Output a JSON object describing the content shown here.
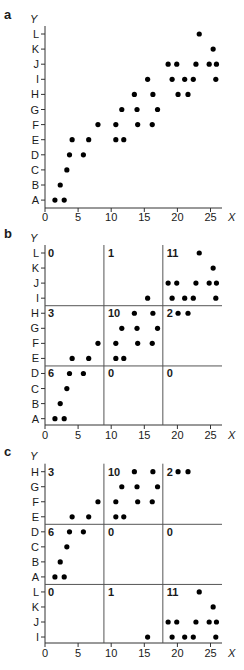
{
  "figure": {
    "width": 244,
    "height": 670,
    "dot_color": "#000000",
    "axis_color": "#333333",
    "divider_color": "#555555"
  },
  "chart_data": [
    {
      "type": "scatter",
      "panel": "a",
      "title": "",
      "xlabel": "X",
      "ylabel": "Y",
      "xticks": [
        0,
        5,
        10,
        15,
        20,
        25
      ],
      "xlim": [
        0,
        26.7
      ],
      "y_categories": [
        "A",
        "B",
        "C",
        "D",
        "E",
        "F",
        "G",
        "H",
        "I",
        "J",
        "K",
        "L"
      ],
      "grid": false,
      "points": [
        {
          "x": 1.5,
          "y": "A"
        },
        {
          "x": 2.9,
          "y": "A"
        },
        {
          "x": 2.3,
          "y": "B"
        },
        {
          "x": 3.3,
          "y": "C"
        },
        {
          "x": 3.7,
          "y": "D"
        },
        {
          "x": 5.8,
          "y": "D"
        },
        {
          "x": 4.1,
          "y": "E"
        },
        {
          "x": 6.6,
          "y": "E"
        },
        {
          "x": 10.7,
          "y": "E"
        },
        {
          "x": 11.9,
          "y": "E"
        },
        {
          "x": 8.0,
          "y": "F"
        },
        {
          "x": 10.7,
          "y": "F"
        },
        {
          "x": 14.0,
          "y": "F"
        },
        {
          "x": 16.2,
          "y": "F"
        },
        {
          "x": 11.6,
          "y": "G"
        },
        {
          "x": 13.9,
          "y": "G"
        },
        {
          "x": 17.0,
          "y": "G"
        },
        {
          "x": 13.5,
          "y": "H"
        },
        {
          "x": 16.3,
          "y": "H"
        },
        {
          "x": 20.1,
          "y": "H"
        },
        {
          "x": 21.6,
          "y": "H"
        },
        {
          "x": 15.5,
          "y": "I"
        },
        {
          "x": 19.2,
          "y": "I"
        },
        {
          "x": 21.1,
          "y": "I"
        },
        {
          "x": 22.4,
          "y": "I"
        },
        {
          "x": 25.8,
          "y": "I"
        },
        {
          "x": 18.6,
          "y": "J"
        },
        {
          "x": 19.9,
          "y": "J"
        },
        {
          "x": 22.8,
          "y": "J"
        },
        {
          "x": 24.8,
          "y": "J"
        },
        {
          "x": 25.9,
          "y": "J"
        },
        {
          "x": 25.4,
          "y": "K"
        },
        {
          "x": 23.3,
          "y": "L"
        }
      ]
    },
    {
      "type": "scatter",
      "panel": "b",
      "title": "",
      "xlabel": "X",
      "ylabel": "Y",
      "xticks": [
        0,
        5,
        10,
        15,
        20,
        25
      ],
      "xlim": [
        0,
        26.7
      ],
      "y_categories": [
        "A",
        "B",
        "C",
        "D",
        "E",
        "F",
        "G",
        "H",
        "I",
        "J",
        "K",
        "L"
      ],
      "x_dividers": [
        8.9,
        17.8
      ],
      "y_dividers_between": [
        [
          "D",
          "E"
        ],
        [
          "H",
          "I"
        ]
      ],
      "region_counts": [
        {
          "row_band": "I-L",
          "col": 0,
          "label": "0"
        },
        {
          "row_band": "I-L",
          "col": 1,
          "label": "1"
        },
        {
          "row_band": "I-L",
          "col": 2,
          "label": "11"
        },
        {
          "row_band": "E-H",
          "col": 0,
          "label": "3"
        },
        {
          "row_band": "E-H",
          "col": 1,
          "label": "10"
        },
        {
          "row_band": "E-H",
          "col": 2,
          "label": "2"
        },
        {
          "row_band": "A-D",
          "col": 0,
          "label": "6"
        },
        {
          "row_band": "A-D",
          "col": 1,
          "label": "0"
        },
        {
          "row_band": "A-D",
          "col": 2,
          "label": "0"
        }
      ],
      "points_same_as": "a"
    },
    {
      "type": "scatter",
      "panel": "c",
      "title": "",
      "xlabel": "X",
      "ylabel": "Y",
      "xticks": [
        0,
        5,
        10,
        15,
        20,
        25
      ],
      "xlim": [
        0,
        26.7
      ],
      "y_categories_top_to_bottom": [
        "H",
        "G",
        "F",
        "E",
        "D",
        "C",
        "B",
        "A",
        "L",
        "K",
        "J",
        "I"
      ],
      "x_dividers": [
        8.9,
        17.8
      ],
      "y_dividers_between": [
        [
          "E",
          "D"
        ],
        [
          "A",
          "L"
        ]
      ],
      "region_counts": [
        {
          "row_band": "E-H",
          "col": 0,
          "label": "3"
        },
        {
          "row_band": "E-H",
          "col": 1,
          "label": "10"
        },
        {
          "row_band": "E-H",
          "col": 2,
          "label": "2"
        },
        {
          "row_band": "A-D",
          "col": 0,
          "label": "6"
        },
        {
          "row_band": "A-D",
          "col": 1,
          "label": "0"
        },
        {
          "row_band": "A-D",
          "col": 2,
          "label": "0"
        },
        {
          "row_band": "I-L",
          "col": 0,
          "label": "0"
        },
        {
          "row_band": "I-L",
          "col": 1,
          "label": "1"
        },
        {
          "row_band": "I-L",
          "col": 2,
          "label": "11"
        }
      ],
      "points_same_as": "a"
    }
  ],
  "panels": [
    {
      "label": "a",
      "ylabel": "Y",
      "xlabel": "X",
      "label_y": 19,
      "ylabel_y": 23,
      "top_row_y": 34,
      "row_pitch": 15.1,
      "axis_y": 208,
      "tick_text_y": 221,
      "rows_top_to_bottom": [
        "L",
        "K",
        "J",
        "I",
        "H",
        "G",
        "F",
        "E",
        "D",
        "C",
        "B",
        "A"
      ],
      "h_dividers_after_index": [],
      "v_dividers": [],
      "regions": []
    },
    {
      "label": "b",
      "ylabel": "Y",
      "xlabel": "X",
      "label_y": 238,
      "ylabel_y": 242,
      "top_row_y": 253,
      "row_pitch": 15.06,
      "axis_y": 425,
      "tick_text_y": 439,
      "rows_top_to_bottom": [
        "L",
        "K",
        "J",
        "I",
        "H",
        "G",
        "F",
        "E",
        "D",
        "C",
        "B",
        "A"
      ],
      "h_dividers_after_index": [
        3,
        7
      ],
      "v_dividers": [
        8.9,
        17.8
      ],
      "regions": [
        {
          "row_index": 0,
          "col": 0,
          "label": "0"
        },
        {
          "row_index": 0,
          "col": 1,
          "label": "1"
        },
        {
          "row_index": 0,
          "col": 2,
          "label": "11"
        },
        {
          "row_index": 4,
          "col": 0,
          "label": "3"
        },
        {
          "row_index": 4,
          "col": 1,
          "label": "10"
        },
        {
          "row_index": 4,
          "col": 2,
          "label": "2"
        },
        {
          "row_index": 8,
          "col": 0,
          "label": "6"
        },
        {
          "row_index": 8,
          "col": 1,
          "label": "0"
        },
        {
          "row_index": 8,
          "col": 2,
          "label": "0"
        }
      ]
    },
    {
      "label": "c",
      "ylabel": "Y",
      "xlabel": "X",
      "label_y": 456,
      "ylabel_y": 460,
      "top_row_y": 471.7,
      "row_pitch": 15.03,
      "axis_y": 643,
      "tick_text_y": 657,
      "rows_top_to_bottom": [
        "H",
        "G",
        "F",
        "E",
        "D",
        "C",
        "B",
        "A",
        "L",
        "K",
        "J",
        "I"
      ],
      "h_dividers_after_index": [
        3,
        7
      ],
      "v_dividers": [
        8.9,
        17.8
      ],
      "regions": [
        {
          "row_index": 0,
          "col": 0,
          "label": "3"
        },
        {
          "row_index": 0,
          "col": 1,
          "label": "10"
        },
        {
          "row_index": 0,
          "col": 2,
          "label": "2"
        },
        {
          "row_index": 4,
          "col": 0,
          "label": "6"
        },
        {
          "row_index": 4,
          "col": 1,
          "label": "0"
        },
        {
          "row_index": 4,
          "col": 2,
          "label": "0"
        },
        {
          "row_index": 8,
          "col": 0,
          "label": "0"
        },
        {
          "row_index": 8,
          "col": 1,
          "label": "1"
        },
        {
          "row_index": 8,
          "col": 2,
          "label": "11"
        }
      ]
    }
  ],
  "axis_geometry": {
    "x0_px": 45,
    "px_per_unit": 6.62,
    "x_end_px": 222,
    "dot_radius": 2.6
  }
}
